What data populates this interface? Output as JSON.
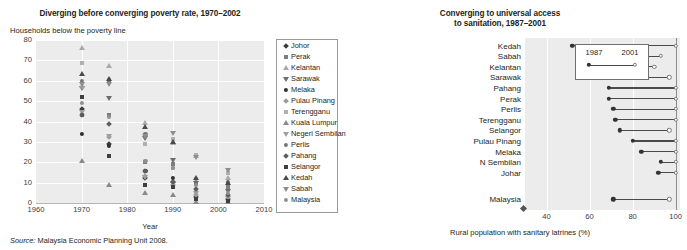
{
  "source_note": {
    "prefix": "Source:",
    "text": " Malaysia Economic Planning Unit 2008."
  },
  "left": {
    "title": "Diverging before converging poverty rate, 1970–2002",
    "ylabel": "Households below the poverty line",
    "xlabel": "Year",
    "yticks": [
      "80",
      "70",
      "60",
      "50",
      "40",
      "30",
      "20",
      "10",
      "0"
    ],
    "xticks": [
      "1960",
      "1970",
      "1980",
      "1990",
      "2000",
      "2010"
    ],
    "legend": [
      {
        "label": "Johor",
        "shape": "diamond",
        "color": "#3b3b3b"
      },
      {
        "label": "Perak",
        "shape": "square",
        "color": "#7d7d7d"
      },
      {
        "label": "Kelantan",
        "shape": "tri-up",
        "color": "#a9a9a9"
      },
      {
        "label": "Sarawak",
        "shape": "tri-down",
        "color": "#6d6d6d"
      },
      {
        "label": "Melaka",
        "shape": "circle",
        "color": "#2f2f2f"
      },
      {
        "label": "Pulau Pinang",
        "shape": "diamond",
        "color": "#9b9b9b"
      },
      {
        "label": "Terengganu",
        "shape": "square",
        "color": "#b0b0b0"
      },
      {
        "label": "Kuala Lumpur",
        "shape": "tri-up",
        "color": "#8a8a8a"
      },
      {
        "label": "Negeri Sembilan",
        "shape": "tri-down",
        "color": "#9f9f9f"
      },
      {
        "label": "Perlis",
        "shape": "circle",
        "color": "#767676"
      },
      {
        "label": "Pahang",
        "shape": "diamond",
        "color": "#5c5c5c"
      },
      {
        "label": "Selangor",
        "shape": "square",
        "color": "#3f3f3f"
      },
      {
        "label": "Kedah",
        "shape": "tri-up",
        "color": "#4a4a4a"
      },
      {
        "label": "Sabah",
        "shape": "tri-down",
        "color": "#8e8e8e"
      },
      {
        "label": "Malaysia",
        "shape": "circle",
        "color": "#909090"
      }
    ]
  },
  "right": {
    "title_line1": "Converging to universal access",
    "title_line2": "to sanitation, 1987–2001",
    "xlabel": "Rural population with sanitary latrines (%)",
    "xticks": [
      "40",
      "60",
      "80",
      "100"
    ],
    "legend": {
      "year_start": "1987",
      "year_end": "2001"
    }
  },
  "chart_data": [
    {
      "type": "scatter",
      "title": "Diverging before converging poverty rate, 1970–2002",
      "xlabel": "Year",
      "ylabel": "Households below the poverty line",
      "xlim": [
        1960,
        2010
      ],
      "ylim": [
        0,
        80
      ],
      "grid": true,
      "legend_position": "right-outside",
      "series": [
        {
          "name": "Johor",
          "x": [
            1970,
            1976,
            1984,
            1990,
            1995,
            2002
          ],
          "y": [
            45.9,
            29.0,
            12.2,
            10.1,
            3.1,
            1.8
          ]
        },
        {
          "name": "Perak",
          "x": [
            1970,
            1976,
            1984,
            1990,
            1995,
            2002
          ],
          "y": [
            43.0,
            43.0,
            20.3,
            19.3,
            9.1,
            7.9
          ]
        },
        {
          "name": "Kelantan",
          "x": [
            1970,
            1976,
            1984,
            1990,
            1995,
            2002
          ],
          "y": [
            76.1,
            67.1,
            39.2,
            29.6,
            22.9,
            12.4
          ]
        },
        {
          "name": "Sarawak",
          "x": [
            1970,
            1976,
            1984,
            1990,
            1995,
            2002
          ],
          "y": [
            56.5,
            51.7,
            31.9,
            21.0,
            10.0,
            5.8
          ]
        },
        {
          "name": "Melaka",
          "x": [
            1970,
            1976,
            1984,
            1990,
            1995,
            2002
          ],
          "y": [
            34.1,
            28.1,
            15.6,
            12.4,
            5.3,
            1.8
          ]
        },
        {
          "name": "Pulau Pinang",
          "x": [
            1970,
            1976,
            1984,
            1990,
            1995,
            2002
          ],
          "y": [
            57.0,
            32.4,
            13.4,
            8.9,
            4.0,
            1.4
          ]
        },
        {
          "name": "Terengganu",
          "x": [
            1970,
            1976,
            1984,
            1990,
            1995,
            2002
          ],
          "y": [
            68.9,
            60.3,
            28.9,
            31.3,
            23.4,
            14.9
          ]
        },
        {
          "name": "Kuala Lumpur",
          "x": [
            1970,
            1976,
            1984,
            1990,
            1995,
            2002
          ],
          "y": [
            20.4,
            9.0,
            4.9,
            3.8,
            0.5,
            0.5
          ]
        },
        {
          "name": "Negeri Sembilan",
          "x": [
            1970,
            1976,
            1984,
            1990,
            1995,
            2002
          ],
          "y": [
            44.8,
            33.0,
            13.0,
            9.5,
            4.9,
            2.6
          ]
        },
        {
          "name": "Perlis",
          "x": [
            1970,
            1976,
            1984,
            1990,
            1995,
            2002
          ],
          "y": [
            59.8,
            59.8,
            33.7,
            17.4,
            11.8,
            10.1
          ]
        },
        {
          "name": "Pahang",
          "x": [
            1970,
            1976,
            1984,
            1990,
            1995,
            2002
          ],
          "y": [
            43.2,
            38.9,
            15.7,
            10.3,
            6.8,
            3.8
          ]
        },
        {
          "name": "Selangor",
          "x": [
            1970,
            1976,
            1984,
            1990,
            1995,
            2002
          ],
          "y": [
            52.2,
            22.9,
            8.6,
            7.8,
            2.2,
            1.1
          ]
        },
        {
          "name": "Kedah",
          "x": [
            1970,
            1976,
            1984,
            1990,
            1995,
            2002
          ],
          "y": [
            63.2,
            61.0,
            37.5,
            30.0,
            12.2,
            9.7
          ]
        },
        {
          "name": "Sabah",
          "x": [
            1970,
            1976,
            1984,
            1990,
            1995,
            2002
          ],
          "y": [
            58.3,
            58.3,
            33.1,
            34.3,
            22.4,
            16.0
          ]
        },
        {
          "name": "Malaysia",
          "x": [
            1970,
            1976,
            1984,
            1990,
            1995,
            2002
          ],
          "y": [
            49.3,
            42.4,
            20.7,
            17.1,
            8.7,
            5.1
          ]
        }
      ]
    },
    {
      "type": "dumbbell",
      "title": "Converging to universal access to sanitation, 1987–2001",
      "xlabel": "Rural population with sanitary latrines (%)",
      "xlim": [
        30,
        102
      ],
      "xticks": [
        40,
        60,
        80,
        100
      ],
      "grid": true,
      "series_names": [
        "1987",
        "2001"
      ],
      "rows": [
        {
          "category": "Kedah",
          "start": 52,
          "end": 100
        },
        {
          "category": "Sabah",
          "start": 64,
          "end": 93
        },
        {
          "category": "Kelantan",
          "start": 63,
          "end": 90
        },
        {
          "category": "Sarawak",
          "start": 69,
          "end": 97
        },
        {
          "category": "Pahang",
          "start": 69,
          "end": 100
        },
        {
          "category": "Perak",
          "start": 69,
          "end": 100
        },
        {
          "category": "Perlis",
          "start": 71,
          "end": 100
        },
        {
          "category": "Terengganu",
          "start": 72,
          "end": 100
        },
        {
          "category": "Selangor",
          "start": 74,
          "end": 97
        },
        {
          "category": "Pulau Pinang",
          "start": 80,
          "end": 100
        },
        {
          "category": "Melaka",
          "start": 84,
          "end": 100
        },
        {
          "category": "N Sembilan",
          "start": 93,
          "end": 100
        },
        {
          "category": "Johar",
          "start": 92,
          "end": 100
        },
        {
          "category": "Malaysia",
          "start": 71,
          "end": 97
        }
      ]
    }
  ]
}
